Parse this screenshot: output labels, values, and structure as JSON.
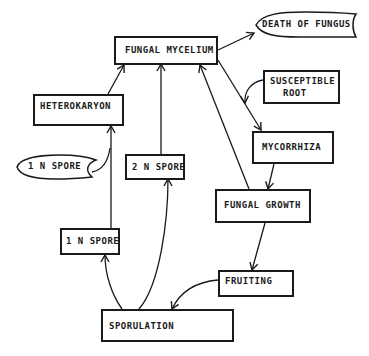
{
  "diagram": {
    "nodes": {
      "fungal_mycelium": "FUNGAL MYCELIUM",
      "death_of_fungus": "DEATH OF FUNGUS",
      "heterokaryon": "HETEROKARYON",
      "one_n_spore_scroll": "1 N SPORE",
      "two_n_spore": "2 N SPORE",
      "susceptible_root_line1": "SUSCEPTIBLE",
      "susceptible_root_line2": "ROOT",
      "mycorrhiza": "MYCORRHIZA",
      "fungal_growth": "FUNGAL GROWTH",
      "one_n_spore_box": "1 N SPORE",
      "fruiting": "FRUITING",
      "sporulation": "SPORULATION"
    },
    "edges": [
      {
        "from": "FUNGAL MYCELIUM",
        "to": "DEATH OF FUNGUS"
      },
      {
        "from": "FUNGAL MYCELIUM",
        "to": "MYCORRHIZA"
      },
      {
        "from": "SUSCEPTIBLE ROOT",
        "to": "MYCORRHIZA"
      },
      {
        "from": "MYCORRHIZA",
        "to": "FUNGAL GROWTH"
      },
      {
        "from": "FUNGAL GROWTH",
        "to": "FUNGAL MYCELIUM"
      },
      {
        "from": "FUNGAL GROWTH",
        "to": "FRUITING"
      },
      {
        "from": "FRUITING",
        "to": "SPORULATION"
      },
      {
        "from": "SPORULATION",
        "to": "1 N SPORE"
      },
      {
        "from": "SPORULATION",
        "to": "2 N SPORE"
      },
      {
        "from": "1 N SPORE",
        "to": "HETEROKARYON"
      },
      {
        "from": "1 N SPORE (scroll)",
        "to": "HETEROKARYON"
      },
      {
        "from": "2 N SPORE",
        "to": "FUNGAL MYCELIUM"
      },
      {
        "from": "HETEROKARYON",
        "to": "FUNGAL MYCELIUM"
      }
    ]
  }
}
